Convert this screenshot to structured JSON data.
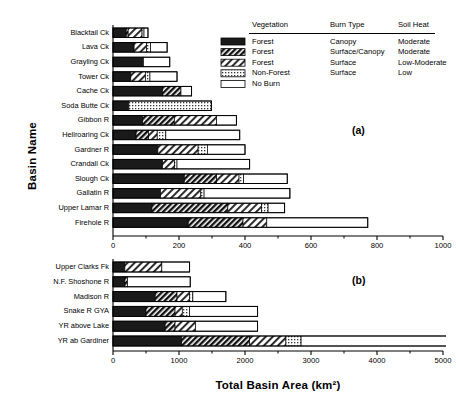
{
  "chart_data": {
    "type": "bar",
    "orientation": "horizontal",
    "stacked": true,
    "title": "",
    "xlabel": "Total Basin Area (km²)",
    "ylabel": "Basin Name",
    "grid": false,
    "legend_position": "top-right",
    "series": [
      {
        "name": "Forest / Canopy / Moderate",
        "key": "canopy",
        "pattern": "solid-black"
      },
      {
        "name": "Forest / Surface–Canopy / Moderate",
        "key": "surfcanopy",
        "pattern": "dense-hatch"
      },
      {
        "name": "Forest / Surface / Low–Moderate",
        "key": "surface",
        "pattern": "medium-hatch"
      },
      {
        "name": "Non-Forest / Surface / Low",
        "key": "nonforest",
        "pattern": "light-stipple"
      },
      {
        "name": "No Burn",
        "key": "noburn",
        "pattern": "white"
      }
    ],
    "panels": [
      {
        "tag": "(a)",
        "xlim": [
          0,
          1000
        ],
        "xticks": [
          0,
          200,
          400,
          600,
          800,
          1000
        ],
        "xticklabels": [
          "0",
          "200",
          "400",
          "600",
          "800",
          "1000"
        ],
        "categories": [
          "Blacktail Ck",
          "Lava Ck",
          "Grayling Ck",
          "Tower Ck",
          "Cache Ck",
          "Soda Butte Ck",
          "Gibbon  R",
          "Hellroaring Ck",
          "Gardner R",
          "Crandall Ck",
          "Slough Ck",
          "Gallatin R",
          "Upper Lamar R",
          "Firehole  R"
        ],
        "rows": [
          {
            "category": "Blacktail Ck",
            "canopy": 40,
            "surfcanopy": 6,
            "surface": 42,
            "nonforest": 6,
            "noburn": 12,
            "total": 106
          },
          {
            "category": "Lava Ck",
            "canopy": 64,
            "surfcanopy": 0,
            "surface": 38,
            "nonforest": 12,
            "noburn": 50,
            "total": 164
          },
          {
            "category": "Grayling Ck",
            "canopy": 92,
            "surfcanopy": 0,
            "surface": 0,
            "nonforest": 0,
            "noburn": 80,
            "total": 172
          },
          {
            "category": "Tower Ck",
            "canopy": 54,
            "surfcanopy": 0,
            "surface": 44,
            "nonforest": 14,
            "noburn": 82,
            "total": 194
          },
          {
            "category": "Cache Ck",
            "canopy": 150,
            "surfcanopy": 56,
            "surface": 0,
            "nonforest": 0,
            "noburn": 32,
            "total": 238
          },
          {
            "category": "Soda Butte Ck",
            "canopy": 48,
            "surfcanopy": 0,
            "surface": 0,
            "nonforest": 250,
            "noburn": 0,
            "total": 298
          },
          {
            "category": "Gibbon  R",
            "canopy": 90,
            "surfcanopy": 96,
            "surface": 128,
            "nonforest": 0,
            "noburn": 60,
            "total": 374
          },
          {
            "category": "Hellroaring Ck",
            "canopy": 70,
            "surfcanopy": 38,
            "surface": 26,
            "nonforest": 26,
            "noburn": 224,
            "total": 384
          },
          {
            "category": "Gardner R",
            "canopy": 136,
            "surfcanopy": 0,
            "surface": 122,
            "nonforest": 28,
            "noburn": 114,
            "total": 400
          },
          {
            "category": "Crandall Ck",
            "canopy": 150,
            "surfcanopy": 0,
            "surface": 36,
            "nonforest": 8,
            "noburn": 220,
            "total": 414
          },
          {
            "category": "Slough Ck",
            "canopy": 216,
            "surfcanopy": 98,
            "surface": 68,
            "nonforest": 14,
            "noburn": 132,
            "total": 528
          },
          {
            "category": "Gallatin R",
            "canopy": 144,
            "surfcanopy": 0,
            "surface": 122,
            "nonforest": 10,
            "noburn": 260,
            "total": 536
          },
          {
            "category": "Upper Lamar R",
            "canopy": 118,
            "surfcanopy": 230,
            "surface": 102,
            "nonforest": 20,
            "noburn": 50,
            "total": 520
          },
          {
            "category": "Firehole  R",
            "canopy": 228,
            "surfcanopy": 166,
            "surface": 72,
            "nonforest": 0,
            "noburn": 306,
            "total": 772
          }
        ]
      },
      {
        "tag": "(b)",
        "xlim": [
          0,
          5000
        ],
        "xticks": [
          0,
          1000,
          2000,
          3000,
          4000,
          5000
        ],
        "xticklabels": [
          "0",
          "1000",
          "2000",
          "3000",
          "4000",
          "5000"
        ],
        "categories": [
          "Upper Clarks Fk",
          "N.F. Shoshone R",
          "Madison R",
          "Snake R GYA",
          "YR above Lake",
          "YR ab Gardiner"
        ],
        "rows": [
          {
            "category": "Upper Clarks Fk",
            "canopy": 180,
            "surfcanopy": 0,
            "surface": 560,
            "nonforest": 0,
            "noburn": 420,
            "total": 1160
          },
          {
            "category": "N.F. Shoshone R",
            "canopy": 180,
            "surfcanopy": 40,
            "surface": 0,
            "nonforest": 0,
            "noburn": 950,
            "total": 1170
          },
          {
            "category": "Madison R",
            "canopy": 640,
            "surfcanopy": 330,
            "surface": 190,
            "nonforest": 50,
            "noburn": 500,
            "total": 1710
          },
          {
            "category": "Snake R GYA",
            "canopy": 500,
            "surfcanopy": 440,
            "surface": 110,
            "nonforest": 110,
            "noburn": 1030,
            "total": 2190
          },
          {
            "category": "YR above Lake",
            "canopy": 790,
            "surfcanopy": 150,
            "surface": 310,
            "nonforest": 0,
            "noburn": 940,
            "total": 2190
          },
          {
            "category": "YR ab Gardiner",
            "canopy": 1040,
            "surfcanopy": 1030,
            "surface": 550,
            "nonforest": 230,
            "noburn": 2210,
            "total": 5060
          }
        ]
      }
    ],
    "legend": {
      "headers": [
        "Vegetation",
        "Burn Type",
        "Soil Heat"
      ],
      "entries": [
        {
          "vegetation": "Forest",
          "burn_type": "Canopy",
          "soil_heat": "Moderate"
        },
        {
          "vegetation": "Forest",
          "burn_type": "Surface/Canopy",
          "soil_heat": "Moderate"
        },
        {
          "vegetation": "Forest",
          "burn_type": "Surface",
          "soil_heat": "Low-Moderate"
        },
        {
          "vegetation": "Non-Forest",
          "burn_type": "Surface",
          "soil_heat": "Low"
        },
        {
          "vegetation": "No Burn",
          "burn_type": "",
          "soil_heat": ""
        }
      ]
    }
  }
}
